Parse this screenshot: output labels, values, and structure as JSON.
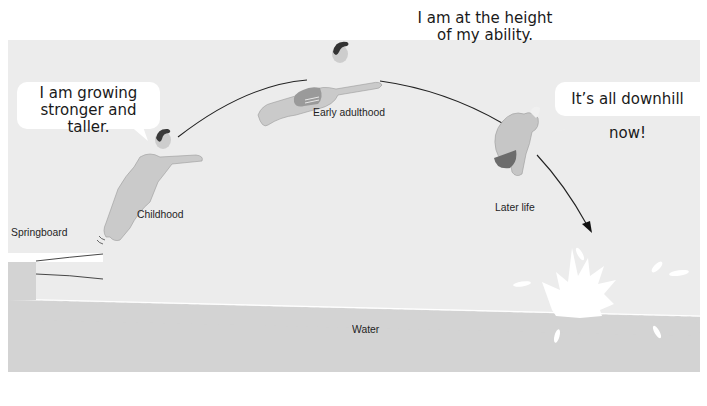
{
  "diagram": {
    "type": "life-stage diving arc illustration",
    "colors": {
      "sky": "#ececec",
      "water": "#d3d3d3",
      "bubble": "#ffffff",
      "line": "#222222",
      "skin": "#c9c9c9",
      "trunks_dark": "#6e6e6e",
      "hair": "#3a3a3a",
      "splash": "#ffffff"
    },
    "stages": [
      {
        "id": "childhood",
        "label": "Childhood",
        "speech": [
          "I am growing",
          "stronger and taller."
        ]
      },
      {
        "id": "early-adulthood",
        "label": "Early adulthood",
        "speech": [
          "I am at the height",
          "of my ability."
        ]
      },
      {
        "id": "later-life",
        "label": "Later life",
        "speech": [
          "It’s all downhill now!"
        ]
      }
    ],
    "labels": {
      "springboard": "Springboard",
      "water": "Water"
    }
  }
}
